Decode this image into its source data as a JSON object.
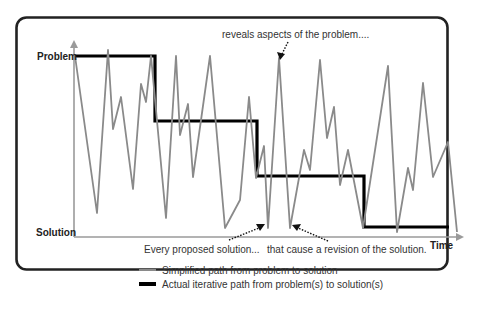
{
  "diagram": {
    "labels": {
      "y_top": "Problem",
      "y_bottom": "Solution",
      "x_axis": "Time"
    },
    "annotations": {
      "top": "reveals aspects of the problem....",
      "bottom_left": "Every proposed solution...",
      "bottom_right": "that cause a revision of the solution."
    },
    "legend": [
      {
        "label": "Simplified path from problem to solution",
        "style": "thin gray line"
      },
      {
        "label": "Actual iterative path from problem(s) to solution(s)",
        "style": "thick black line"
      }
    ],
    "colors": {
      "gray_path": "#8a8a8a",
      "black_path": "#000000",
      "axis": "#9a9a9a",
      "frame": "#222222"
    },
    "gray_path_points": "75,56 97,213 108,50 113,129 121,97 133,189 141,84 146,102 151,56 166,218 176,56 180,135 188,104 193,177 210,56 225,228 240,200 249,97 256,178 264,146 268,228 279,58 290,228 304,150 310,170 320,60 327,138 334,107 340,185 348,150 363,228 388,66 397,232 408,168 413,190 423,83 433,177 448,142 457,232",
    "black_path_points": "75,56 155,56 155,121 257,121 257,176 364,176 364,227 449,227"
  }
}
